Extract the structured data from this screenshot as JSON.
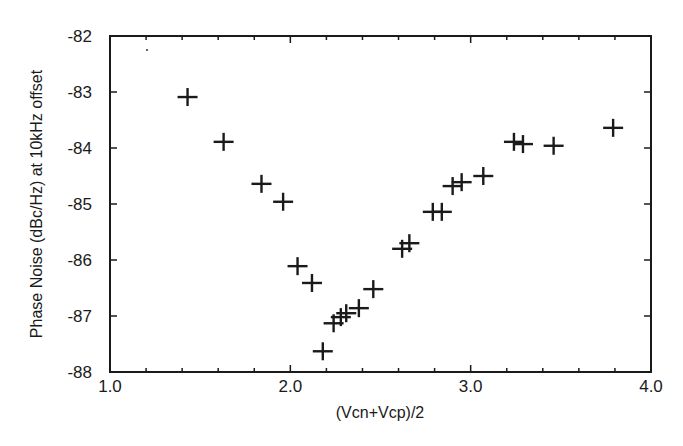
{
  "chart_data": {
    "type": "scatter",
    "title": "",
    "xlabel": "(Vcn+Vcp)/2",
    "ylabel": "Phase Noise (dBc/Hz) at 10kHz offset",
    "xlim": [
      1.0,
      4.0
    ],
    "ylim": [
      -88,
      -82
    ],
    "x_ticks": [
      "1.0",
      "2.0",
      "3.0",
      "4.0"
    ],
    "y_ticks": [
      "-82",
      "-83",
      "-84",
      "-85",
      "-86",
      "-87",
      "-88"
    ],
    "grid": false,
    "legend": null,
    "marker": "plus",
    "series": [
      {
        "name": "Phase noise",
        "points": [
          {
            "x": 1.43,
            "y": -83.09
          },
          {
            "x": 1.63,
            "y": -83.89
          },
          {
            "x": 1.84,
            "y": -84.64
          },
          {
            "x": 1.96,
            "y": -84.96
          },
          {
            "x": 2.04,
            "y": -86.11
          },
          {
            "x": 2.12,
            "y": -86.41
          },
          {
            "x": 2.18,
            "y": -87.63
          },
          {
            "x": 2.24,
            "y": -87.13
          },
          {
            "x": 2.28,
            "y": -87.02
          },
          {
            "x": 2.31,
            "y": -86.95
          },
          {
            "x": 2.38,
            "y": -86.86
          },
          {
            "x": 2.46,
            "y": -86.52
          },
          {
            "x": 2.62,
            "y": -85.8
          },
          {
            "x": 2.66,
            "y": -85.7
          },
          {
            "x": 2.79,
            "y": -85.14
          },
          {
            "x": 2.84,
            "y": -85.14
          },
          {
            "x": 2.9,
            "y": -84.68
          },
          {
            "x": 2.95,
            "y": -84.61
          },
          {
            "x": 3.07,
            "y": -84.5
          },
          {
            "x": 3.24,
            "y": -83.89
          },
          {
            "x": 3.29,
            "y": -83.93
          },
          {
            "x": 3.46,
            "y": -83.96
          },
          {
            "x": 3.79,
            "y": -83.64
          }
        ]
      }
    ]
  },
  "colors": {
    "ink": "#1a1a1a",
    "background": "#ffffff"
  }
}
